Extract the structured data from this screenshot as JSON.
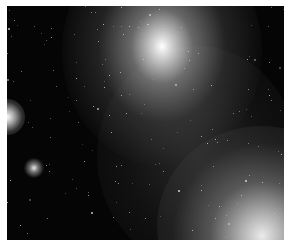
{
  "image": {
    "subject": "star field with diffuse glowing sources",
    "background_color": "#050505",
    "border_color": "#ffffff",
    "glows": [
      {
        "name": "top-center-glow",
        "cx": 149,
        "cy": 36
      },
      {
        "name": "left-edge-glow",
        "cx": 0,
        "cy": 111
      },
      {
        "name": "small-left-glow",
        "cx": 26,
        "cy": 162
      },
      {
        "name": "bottom-right-glow",
        "cx": 245,
        "cy": 222
      }
    ]
  }
}
